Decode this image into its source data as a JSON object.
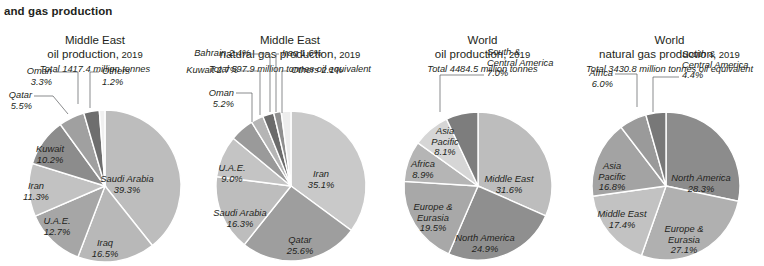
{
  "page": {
    "heading": "and gas production"
  },
  "style": {
    "text_color": "#231f20",
    "leader_color": "#58595b",
    "slice_stroke": "#ffffff",
    "background": "#ffffff"
  },
  "chart_data": [
    {
      "type": "pie",
      "title_line1": "Middle East",
      "title_line2": "oil production,",
      "title_year": "2019",
      "total": "Total 1417.4 million tonnes",
      "cx": 105,
      "cy": 152,
      "r": 76,
      "start_angle": -90,
      "categories": [
        "Saudi Arabia",
        "Iraq",
        "U.A.E.",
        "Iran",
        "Kuwait",
        "Qatar",
        "Oman",
        "Others"
      ],
      "values": [
        39.3,
        16.5,
        12.7,
        11.3,
        10.2,
        5.5,
        3.3,
        1.2
      ],
      "labels": [
        {
          "name": "Saudi Arabia",
          "pct": "39.3%",
          "placement": "inner",
          "lx": 127,
          "ly": 148,
          "anchor": "middle"
        },
        {
          "name": "Iraq",
          "pct": "16.5%",
          "placement": "inner",
          "lx": 105,
          "ly": 212,
          "anchor": "middle"
        },
        {
          "name": "U.A.E.",
          "pct": "12.7%",
          "placement": "inner",
          "lx": 57,
          "ly": 190,
          "anchor": "middle"
        },
        {
          "name": "Iran",
          "pct": "11.3%",
          "placement": "inner",
          "lx": 36,
          "ly": 155,
          "anchor": "middle"
        },
        {
          "name": "Kuwait",
          "pct": "10.2%",
          "placement": "inner",
          "lx": 50,
          "ly": 118,
          "anchor": "middle"
        },
        {
          "name": "Qatar",
          "pct": "5.5%",
          "placement": "outer",
          "lx": 32,
          "ly": 64,
          "anchor": "end",
          "leader": "M 34,62 L 53,62 L 68,80"
        },
        {
          "name": "Oman",
          "pct": "3.3%",
          "placement": "outer",
          "lx": 52,
          "ly": 40,
          "anchor": "end",
          "leader": "M 54,38 L 78,38 L 78,70"
        },
        {
          "name": "Others",
          "pct": "1.2%",
          "placement": "outer",
          "lx": 102,
          "ly": 40,
          "anchor": "start",
          "leader": "M 99,38 L 90,38 L 90,74"
        }
      ],
      "colors": [
        "#bdbdbd",
        "#b8b8b8",
        "#a6a6a6",
        "#c2c2c2",
        "#8c8c8c",
        "#a0a0a0",
        "#6e6e6e",
        "#f0f0f0"
      ]
    },
    {
      "type": "pie",
      "title_line1": "Middle East",
      "title_line2": "natural gas production,",
      "title_year": "2019",
      "total": "Total 597.9 million tonnes oil equivalent",
      "cx": 101,
      "cy": 152,
      "r": 75,
      "start_angle": -90,
      "categories": [
        "Iran",
        "Qatar",
        "Saudi Arabia",
        "U.A.E.",
        "Oman",
        "Kuwait",
        "Bahrain",
        "Iraq",
        "Others"
      ],
      "values": [
        35.1,
        25.6,
        16.3,
        9.0,
        5.2,
        2.7,
        2.4,
        1.6,
        2.1
      ],
      "labels": [
        {
          "name": "Iran",
          "pct": "35.1%",
          "placement": "inner",
          "lx": 131,
          "ly": 143,
          "anchor": "middle"
        },
        {
          "name": "Qatar",
          "pct": "25.6%",
          "placement": "inner",
          "lx": 110,
          "ly": 209,
          "anchor": "middle"
        },
        {
          "name": "Saudi Arabia",
          "pct": "16.3%",
          "placement": "inner",
          "lx": 50,
          "ly": 182,
          "anchor": "middle"
        },
        {
          "name": "U.A.E.",
          "pct": "9.0%",
          "placement": "inner",
          "lx": 42,
          "ly": 137,
          "anchor": "middle"
        },
        {
          "name": "Oman",
          "pct": "5.2%",
          "placement": "outer",
          "lx": 44,
          "ly": 62,
          "anchor": "end",
          "leader": "M 46,59 L 62,59 L 62,88"
        },
        {
          "name": "Kuwait 2.7%",
          "pct": "",
          "placement": "outer",
          "lx": 48,
          "ly": 39,
          "anchor": "end",
          "leader": "M 50,37 L 70,37 L 70,81"
        },
        {
          "name": "Bahrain 2.4%",
          "pct": "",
          "placement": "outer",
          "lx": 60,
          "ly": 22,
          "anchor": "end",
          "leader": "M 62,20 L 80,20 L 80,78"
        },
        {
          "name": "Iraq 1.6%",
          "pct": "",
          "placement": "outer",
          "lx": 92,
          "ly": 22,
          "anchor": "start",
          "leader": "M 89,20 L 86,20 L 86,78"
        },
        {
          "name": "Others 2.1%",
          "pct": "",
          "placement": "outer",
          "lx": 101,
          "ly": 39,
          "anchor": "start",
          "leader": "M 98,37 L 92,37 L 92,79"
        }
      ],
      "colors": [
        "#c9c9c9",
        "#9e9e9e",
        "#bdbdbd",
        "#c4c4c4",
        "#9a9a9a",
        "#b5b5b5",
        "#6b6b6b",
        "#8f8f8f",
        "#ededed"
      ]
    },
    {
      "type": "pie",
      "title_line1": "World",
      "title_line2": "oil production,",
      "title_year": "2019",
      "total": "Total 4484.5 million tonnes",
      "cx": 88,
      "cy": 152,
      "r": 74,
      "start_angle": -90,
      "categories": [
        "Middle East",
        "North America",
        "Europe & Eurasia",
        "Africa",
        "Asia Pacific",
        "South & Central America"
      ],
      "values": [
        31.6,
        24.9,
        19.5,
        8.9,
        8.1,
        7.0
      ],
      "labels": [
        {
          "name": "Middle East",
          "pct": "31.6%",
          "placement": "inner",
          "lx": 119,
          "ly": 148,
          "anchor": "middle"
        },
        {
          "name": "North America",
          "pct": "24.9%",
          "placement": "inner",
          "lx": 95,
          "ly": 207,
          "anchor": "middle"
        },
        {
          "name": "Europe &",
          "name2": "Eurasia",
          "pct": "19.5%",
          "placement": "inner3",
          "lx": 43,
          "ly": 176,
          "anchor": "middle"
        },
        {
          "name": "Africa",
          "pct": "8.9%",
          "placement": "inner",
          "lx": 33,
          "ly": 133,
          "anchor": "middle"
        },
        {
          "name": "Asia",
          "name2": "Pacific",
          "pct": "8.1%",
          "placement": "inner3",
          "lx": 55,
          "ly": 100,
          "anchor": "middle"
        },
        {
          "name": "South &",
          "name2": "Central America",
          "pct": "7.0%",
          "placement": "outer3",
          "lx": 97,
          "ly": 21,
          "anchor": "start",
          "leader": "M 94,41 L 50,41 L 50,78"
        }
      ],
      "colors": [
        "#bdbdbd",
        "#8f8f8f",
        "#a8a8a8",
        "#b5b5b5",
        "#d6d6d6",
        "#7d7d7d"
      ]
    },
    {
      "type": "pie",
      "title_line1": "World",
      "title_line2": "natural gas production,",
      "title_year": "2019",
      "total": "Total 3430.8 million tonnes oil equivalent",
      "cx": 91,
      "cy": 152,
      "r": 74,
      "start_angle": -90,
      "categories": [
        "North America",
        "Europe & Eurasia",
        "Middle East",
        "Asia Pacific",
        "Africa",
        "South & Central America"
      ],
      "values": [
        28.3,
        27.1,
        17.4,
        16.8,
        6.0,
        4.4
      ],
      "labels": [
        {
          "name": "North America",
          "pct": "28.3%",
          "placement": "inner",
          "lx": 126,
          "ly": 147,
          "anchor": "middle"
        },
        {
          "name": "Europe &",
          "name2": "Eurasia",
          "pct": "27.1%",
          "placement": "inner3",
          "lx": 109,
          "ly": 198,
          "anchor": "middle"
        },
        {
          "name": "Middle East",
          "pct": "17.4%",
          "placement": "inner",
          "lx": 47,
          "ly": 183,
          "anchor": "middle"
        },
        {
          "name": "Asia",
          "name2": "Pacific",
          "pct": "16.8%",
          "placement": "inner3",
          "lx": 37,
          "ly": 135,
          "anchor": "middle"
        },
        {
          "name": "Africa",
          "pct": "6.0%",
          "placement": "outer",
          "lx": 38,
          "ly": 42,
          "anchor": "end",
          "leader": "M 40,40 L 62,40 L 62,73"
        },
        {
          "name": "South &",
          "name2": "Central America",
          "pct": "4.4%",
          "placement": "outer3",
          "lx": 107,
          "ly": 23,
          "anchor": "start",
          "leader": "M 104,43 L 78,43 L 78,78"
        }
      ],
      "colors": [
        "#8c8c8c",
        "#b0b0b0",
        "#c2c2c2",
        "#a3a3a3",
        "#9a9a9a",
        "#787878"
      ]
    }
  ],
  "panel_widths": [
    190,
    200,
    185,
    189
  ]
}
